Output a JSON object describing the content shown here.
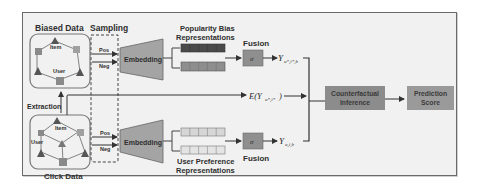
{
  "diagram": {
    "biased_data": {
      "title": "Biased Data",
      "item_label": "Item",
      "user_label": "User"
    },
    "click_data": {
      "title": "Click Data",
      "item_label": "Item",
      "user_label": "User"
    },
    "extraction_label": "Extraction",
    "sampling": {
      "title": "Sampling",
      "pos_label": "Pos",
      "neg_label": "Neg"
    },
    "embedding_top": {
      "label": "Embedding"
    },
    "embedding_bottom": {
      "label": "Embedding"
    },
    "popularity_bias": {
      "line1": "Popularity Bias",
      "line2": "Representations"
    },
    "user_preference": {
      "line1": "User Preference",
      "line2": "Representations"
    },
    "fusion_top": {
      "title": "Fusion",
      "symbol": "σ"
    },
    "fusion_bottom": {
      "title": "Fusion",
      "symbol": "σ"
    },
    "outputs": {
      "top": {
        "base": "Y",
        "sub": "u*,i*,b"
      },
      "middle": {
        "prefix": "E(Y",
        "sub": "u*,i*",
        "suffix": ")"
      },
      "bottom": {
        "base": "Y",
        "sub": "u,i,b"
      }
    },
    "counterfactual": {
      "line1": "Counterfactual",
      "line2": "Inference"
    },
    "prediction": {
      "line1": "Prediction",
      "line2": "Score"
    },
    "colors": {
      "frame_bg": "#f1f1f1",
      "embedding_fill": "#a4a4a4",
      "bias_dark": "#4a4a4a",
      "bias_medium": "#8e8e8e",
      "pref_light": "#d6d6d6",
      "fusion_fill": "#8f8f8f",
      "counterfactual_fill": "#8c8c8c",
      "prediction_fill": "#9a9a9a",
      "node_square": "#8a8a8a",
      "node_triangle": "#555555"
    }
  }
}
